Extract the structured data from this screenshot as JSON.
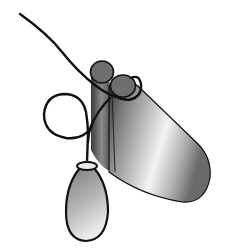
{
  "figure": {
    "background": "#ffffff",
    "colors": {
      "outline": "#111111",
      "lumen_fill": "#6e6e6e",
      "tube_dark": "#3a3a3a",
      "tube_light": "#f2f2f2",
      "balloon_dark": "#6a6a6a",
      "balloon_light": "#e6e6e6"
    },
    "parts": [
      "guide-wire",
      "wire-loop",
      "double-lumen-tube",
      "balloon"
    ]
  }
}
